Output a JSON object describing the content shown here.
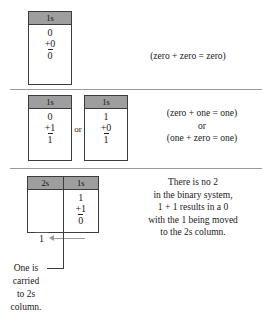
{
  "figure": {
    "separator_color": "#9a9a9a",
    "header_fill": "#9e9e9e",
    "border_color": "#3c3c3c",
    "arrow_color": "#9b9b9b"
  },
  "rows": [
    {
      "id": "row-zero-plus-zero",
      "boxes": [
        {
          "id": "box1",
          "headers": [
            "1s"
          ],
          "columns": [
            {
              "top": "0",
              "addend": "+0",
              "sum": "0"
            }
          ]
        }
      ],
      "explanation": "(zero + zero = zero)"
    },
    {
      "id": "row-zero-plus-one",
      "connector": "or",
      "boxes": [
        {
          "id": "box2",
          "headers": [
            "1s"
          ],
          "columns": [
            {
              "top": "0",
              "addend": "+1",
              "sum": "1"
            }
          ]
        },
        {
          "id": "box3",
          "headers": [
            "1s"
          ],
          "columns": [
            {
              "top": "1",
              "addend": "+0",
              "sum": "1"
            }
          ]
        }
      ],
      "explanation": "(zero + one = one)\nor\n(one + zero = one)"
    },
    {
      "id": "row-one-plus-one",
      "boxes": [
        {
          "id": "box4",
          "headers": [
            "2s",
            "1s"
          ],
          "columns": [
            {
              "top": "",
              "addend": "",
              "sum": "1",
              "carry": "1"
            },
            {
              "top": "1",
              "addend": "+1",
              "sum": "0"
            }
          ]
        }
      ],
      "explanation": "There is no 2\nin the binary system,\n1 + 1 results in a 0\nwith the 1 being moved\nto the 2s column."
    }
  ],
  "caption": {
    "text": "One is\ncarried\nto 2s\ncolumn."
  }
}
